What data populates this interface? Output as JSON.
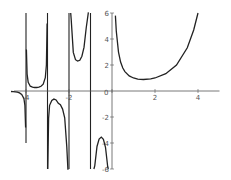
{
  "chart_data": {
    "type": "line",
    "title": "",
    "xlabel": "",
    "ylabel": "",
    "function": "Gamma(x)",
    "xlim": [
      -4.56,
      5.0
    ],
    "ylim": [
      -6,
      6
    ],
    "grid": false,
    "legend": null,
    "x_ticks": [
      -4,
      -2,
      0,
      2,
      4
    ],
    "x_tick_labels": [
      "-4",
      "-2",
      "0",
      "2",
      "4"
    ],
    "y_ticks": [
      -6,
      -4,
      -2,
      2,
      4,
      6
    ],
    "y_tick_labels": [
      "-6",
      "-4",
      "-2",
      "2",
      "4",
      "6"
    ],
    "origin_label": "0",
    "asymptotes": [
      -4,
      -3,
      -2,
      -1,
      0
    ],
    "series": [
      {
        "name": "Γ(x) on (-4.7,-4)",
        "x": [
          -4.7,
          -4.6,
          -4.5,
          -4.4,
          -4.3,
          -4.2,
          -4.1,
          -4.05,
          -4.02
        ],
        "y": [
          -0.036,
          -0.044,
          -0.06,
          -0.089,
          -0.146,
          -0.261,
          -0.57,
          -1.1,
          -2.8
        ]
      },
      {
        "name": "Γ(x) on (-4,-3)",
        "x": [
          -3.98,
          -3.95,
          -3.9,
          -3.8,
          -3.7,
          -3.6,
          -3.5,
          -3.4,
          -3.3,
          -3.2,
          -3.1,
          -3.05,
          -3.02
        ],
        "y": [
          3.2,
          1.3,
          0.66,
          0.37,
          0.29,
          0.27,
          0.27,
          0.29,
          0.36,
          0.52,
          1.02,
          2.0,
          5.2
        ]
      },
      {
        "name": "Γ(x) on (-3,-2)",
        "x": [
          -2.985,
          -2.95,
          -2.9,
          -2.8,
          -2.7,
          -2.6,
          -2.5,
          -2.4,
          -2.3,
          -2.2,
          -2.1,
          -2.05,
          -2.02
        ],
        "y": [
          -6.0,
          -2.1,
          -1.1,
          -0.72,
          -0.62,
          -0.69,
          -0.945,
          -1.06,
          -1.39,
          -2.06,
          -4.3,
          -8.0,
          -20.0
        ]
      },
      {
        "name": "Γ(x) on (-2,-1)",
        "x": [
          -1.92,
          -1.9,
          -1.8,
          -1.7,
          -1.6,
          -1.5,
          -1.4,
          -1.3,
          -1.2,
          -1.1,
          -1.08
        ],
        "y": [
          6.3,
          5.5,
          2.97,
          2.41,
          2.31,
          2.363,
          2.68,
          3.35,
          4.85,
          9.7,
          12.0
        ]
      },
      {
        "name": "Γ(x) on (-1,0)",
        "x": [
          -0.84,
          -0.8,
          -0.7,
          -0.6,
          -0.5,
          -0.4,
          -0.3,
          -0.2,
          -0.17
        ],
        "y": [
          -6.6,
          -5.74,
          -4.27,
          -3.7,
          -3.545,
          -3.72,
          -4.33,
          -5.82,
          -6.9
        ]
      },
      {
        "name": "Γ(x) on (0,4)",
        "x": [
          0.16,
          0.2,
          0.3,
          0.4,
          0.5,
          0.6,
          0.8,
          1.0,
          1.2,
          1.46,
          1.8,
          2.0,
          2.5,
          3.0,
          3.5,
          3.8,
          4.0
        ],
        "y": [
          5.8,
          4.59,
          2.99,
          2.22,
          1.77,
          1.49,
          1.16,
          1.0,
          0.918,
          0.886,
          0.931,
          1.0,
          1.33,
          2.0,
          3.32,
          4.69,
          6.0
        ]
      }
    ]
  }
}
